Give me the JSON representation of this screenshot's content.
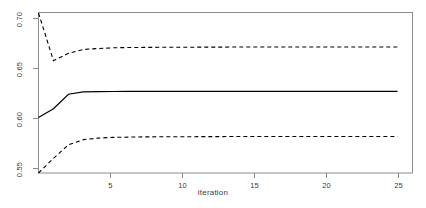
{
  "chart_data": {
    "type": "line",
    "title": "",
    "xlabel": "iteration",
    "ylabel": "",
    "xlim": [
      1,
      26
    ],
    "ylim": [
      0.5425,
      0.7075
    ],
    "grid": false,
    "legend": "none",
    "xticks": [
      5,
      10,
      15,
      20,
      25
    ],
    "xtick_labels": [
      "5",
      "10",
      "15",
      "20",
      "25"
    ],
    "yticks": [
      0.55,
      0.6,
      0.65,
      0.7
    ],
    "ytick_labels": [
      "0.55",
      "0.60",
      "0.65",
      "0.70"
    ],
    "x": [
      1,
      2,
      3,
      4,
      5,
      6,
      7,
      8,
      9,
      10,
      11,
      12,
      13,
      14,
      15,
      16,
      17,
      18,
      19,
      20,
      21,
      22,
      23,
      24,
      25
    ],
    "series": [
      {
        "name": "upper-bound",
        "style": "dashed",
        "color": "#000000",
        "values": [
          0.707,
          0.658,
          0.6655,
          0.6695,
          0.6705,
          0.6712,
          0.6715,
          0.6716,
          0.6717,
          0.6718,
          0.6718,
          0.6719,
          0.6719,
          0.672,
          0.672,
          0.672,
          0.672,
          0.672,
          0.672,
          0.672,
          0.672,
          0.672,
          0.672,
          0.672,
          0.672
        ]
      },
      {
        "name": "estimate",
        "style": "solid",
        "color": "#000000",
        "values": [
          0.5995,
          0.6085,
          0.6235,
          0.6258,
          0.6262,
          0.6263,
          0.6264,
          0.6264,
          0.6264,
          0.6264,
          0.6264,
          0.6264,
          0.6264,
          0.6264,
          0.6264,
          0.6264,
          0.6264,
          0.6264,
          0.6264,
          0.6264,
          0.6264,
          0.6264,
          0.6264,
          0.6264,
          0.6264
        ]
      },
      {
        "name": "lower-bound",
        "style": "dashed",
        "color": "#000000",
        "values": [
          0.5425,
          0.5575,
          0.5715,
          0.5768,
          0.5784,
          0.5791,
          0.5794,
          0.5796,
          0.5797,
          0.5798,
          0.5798,
          0.5799,
          0.5799,
          0.58,
          0.58,
          0.58,
          0.58,
          0.58,
          0.58,
          0.58,
          0.58,
          0.58,
          0.58,
          0.58,
          0.58
        ]
      }
    ]
  },
  "axis": {
    "x_title": "iteration",
    "y_title": "",
    "x_tick_labels": [
      "5",
      "10",
      "15",
      "20",
      "25"
    ],
    "y_tick_labels": [
      "0.55",
      "0.60",
      "0.65",
      "0.70"
    ]
  },
  "colors": {
    "line": "#000000",
    "axis": "#808080",
    "text": "#3b3b3b",
    "background": "#ffffff"
  }
}
